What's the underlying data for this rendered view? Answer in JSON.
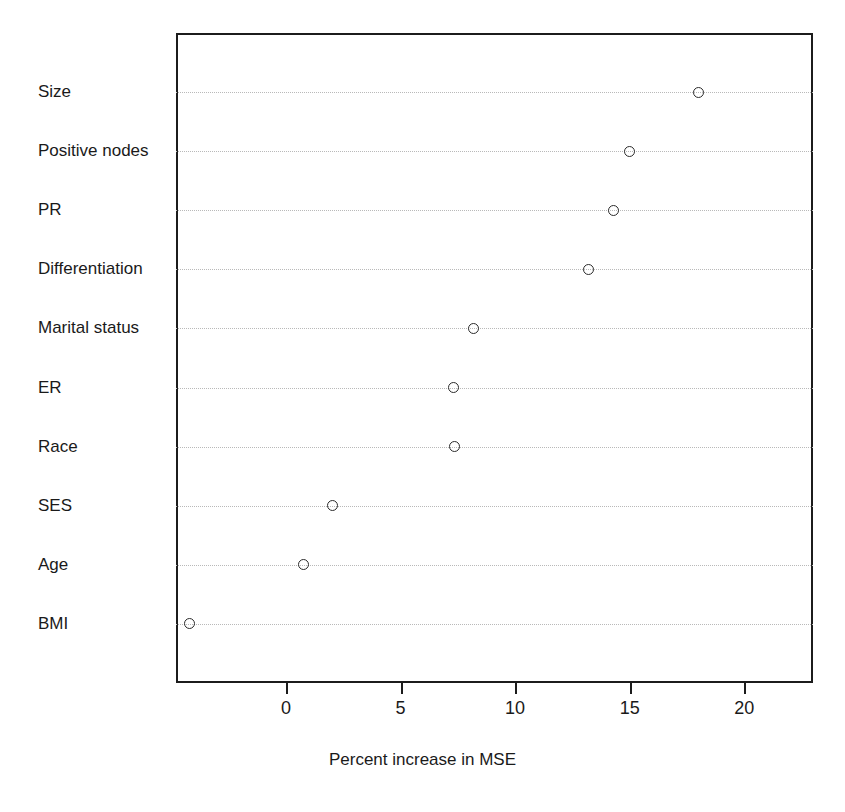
{
  "chart_data": {
    "type": "scatter",
    "title": "",
    "xlabel": "Percent increase in MSE",
    "ylabel": "",
    "xlim": [
      -4.8,
      23.0
    ],
    "ylim": [
      0.5,
      10.5
    ],
    "grid": "dotted horizontal rows",
    "legend": "none",
    "orientation": "horizontal dot plot (variable importance)",
    "xticks": [
      {
        "value": 0,
        "label": "0"
      },
      {
        "value": 5,
        "label": "5"
      },
      {
        "value": 10,
        "label": "10"
      },
      {
        "value": 15,
        "label": "15"
      },
      {
        "value": 20,
        "label": "20"
      }
    ],
    "categories": [
      "Size",
      "Positive nodes",
      "PR",
      "Differentiation",
      "Marital status",
      "ER",
      "Race",
      "SES",
      "Age",
      "BMI"
    ],
    "values": [
      18.0,
      15.0,
      14.3,
      13.2,
      8.2,
      7.3,
      7.35,
      2.05,
      0.77,
      -4.2
    ],
    "points": [
      {
        "category": "Size",
        "value": 18.0
      },
      {
        "category": "Positive nodes",
        "value": 15.0
      },
      {
        "category": "PR",
        "value": 14.3
      },
      {
        "category": "Differentiation",
        "value": 13.2
      },
      {
        "category": "Marital status",
        "value": 8.2
      },
      {
        "category": "ER",
        "value": 7.3
      },
      {
        "category": "Race",
        "value": 7.35
      },
      {
        "category": "SES",
        "value": 2.05
      },
      {
        "category": "Age",
        "value": 0.77
      },
      {
        "category": "BMI",
        "value": -4.2
      }
    ],
    "marker": "open-circle",
    "colors": {
      "marker_stroke": "#2b2b2b",
      "axis": "#1c1c1c",
      "grid": "#b9b9b9",
      "background": "#ffffff",
      "text": "#1a1a1a"
    }
  }
}
